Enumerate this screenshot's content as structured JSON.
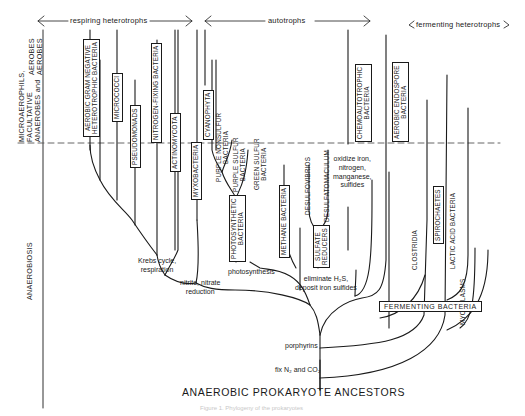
{
  "categories": {
    "respiring": "respiring heterotrophs",
    "autotrophs": "autotrophs",
    "fermenting": "fermenting heterotrophs"
  },
  "zones": {
    "aerobes": "AEROBES\nAEROBES",
    "micro": "MICROAEROPHILS,\nFACULTATIVE\nANAEROBES and",
    "anaerobiosis": "ANAEROBIOSIS"
  },
  "taxa": {
    "aerobic_gram_negative": "AEROBIC GRAM NEGATIVE\nHETEROTROPHIC BACTERIA",
    "micrococci": "MICROCOCCI",
    "pseudomonads": "PSEUDOMONADS",
    "nitrogen_fixing": "NITROGEN-FIXING BACTERIA",
    "actinomycota": "ACTINOMYCOTA",
    "myxobacteria": "MYXOBACTERIA",
    "cyanophyta": "CYANOPHYTA",
    "purple_nonsulfur": "PURPLE NONSULFUR\nBACTERIA",
    "purple_sulfur": "PURPLE SULFUR\nBACTERIA",
    "green_sulfur": "GREEN SULFUR\nBACTERIA",
    "photosynthetic": "PHOTOSYNTHETIC\nBACTERIA",
    "methane": "METHANE BACTERIA",
    "desulfovibrios": "DESULFOVIBRIOS",
    "desulfatomaculum": "DESULFATOMACULUM",
    "sulfate_reducers": "SULFATE\nREDUCERS",
    "chemoautotrophic": "CHEMOAUTOTROPHIC\nBACTERIA",
    "aerobic_endospore": "AEROBIC ENDOSPORE\nBACTERIA",
    "clostridia": "CLOSTRIDIA",
    "spirochaetes": "SPIROCHAETES",
    "lactic_acid": "LACTIC ACID BACTERIA",
    "mycoplasms": "MYCOPLASMS",
    "fermenting_bacteria": "FERMENTING BACTERIA"
  },
  "annotations": {
    "krebs": "Krebs cycle,\nrespiration",
    "nitrite": "nitrite, nitrate\nreduction",
    "photosynthesis": "photosynthesis",
    "eliminate": "eliminate H₂S,\ndeposit iron sulfides",
    "oxidize": "oxidize iron,\nnitrogen,\nmanganese,\nsulfides",
    "porphyrins": "porphyrins",
    "fix": "fix N₂ and CO₂"
  },
  "root": "ANAEROBIC PROKARYOTE ANCESTORS",
  "caption": "Figure 1. Phylogeny of the prokaryotes",
  "colors": {
    "ink": "#1a1a1a",
    "dashed": "#555555",
    "background": "#ffffff"
  }
}
